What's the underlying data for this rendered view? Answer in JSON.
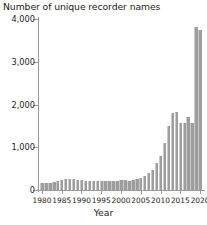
{
  "chart": {
    "title": "Number of unique recorder names",
    "xlabel": "Year",
    "bar_color": "#9d9d9d",
    "axis_color": "#9a9a9a",
    "text_color": "#1d1d1d"
  },
  "chart_data": {
    "type": "bar",
    "title": "Number of unique recorder names",
    "xlabel": "Year",
    "ylabel": "",
    "ylim": [
      0,
      4000
    ],
    "xlim": [
      1979,
      2021
    ],
    "grid": false,
    "legend": null,
    "ytick_labels": [
      "0",
      "1,000",
      "2,000",
      "3,000",
      "4,000"
    ],
    "ytick_values": [
      0,
      1000,
      2000,
      3000,
      4000
    ],
    "xtick_labels": [
      "1980",
      "1985",
      "1990",
      "1995",
      "2000",
      "2005",
      "2010",
      "2015",
      "2020"
    ],
    "xtick_values": [
      1980,
      1985,
      1990,
      1995,
      2000,
      2005,
      2010,
      2015,
      2020
    ],
    "categories": [
      1980,
      1981,
      1982,
      1983,
      1984,
      1985,
      1986,
      1987,
      1988,
      1989,
      1990,
      1991,
      1992,
      1993,
      1994,
      1995,
      1996,
      1997,
      1998,
      1999,
      2000,
      2001,
      2002,
      2003,
      2004,
      2005,
      2006,
      2007,
      2008,
      2009,
      2010,
      2011,
      2012,
      2013,
      2014,
      2015,
      2016,
      2017,
      2018,
      2019,
      2020
    ],
    "values": [
      160,
      165,
      170,
      185,
      215,
      240,
      255,
      255,
      250,
      240,
      225,
      215,
      210,
      205,
      205,
      200,
      215,
      215,
      215,
      205,
      230,
      230,
      215,
      230,
      265,
      290,
      330,
      400,
      460,
      625,
      790,
      1090,
      1490,
      1790,
      1820,
      1560,
      1560,
      1710,
      1565,
      3820,
      3750
    ]
  }
}
